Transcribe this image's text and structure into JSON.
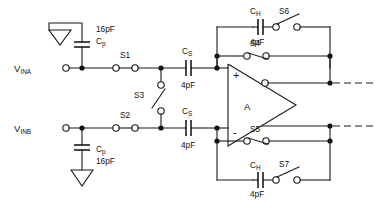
{
  "diagram": {
    "amplifier": {
      "label": "A",
      "plus_pin": "+",
      "minus_pin": "-"
    },
    "ports": [
      {
        "name": "vina",
        "label_main": "V",
        "label_sub": "INA"
      },
      {
        "name": "vinb",
        "label_main": "V",
        "label_sub": "INB"
      }
    ],
    "capacitors": [
      {
        "name": "cp-top",
        "label_main": "C",
        "label_sub": "p",
        "value": "16pF"
      },
      {
        "name": "cp-bottom",
        "label_main": "C",
        "label_sub": "p",
        "value": "16pF"
      },
      {
        "name": "cs-top",
        "label_main": "C",
        "label_sub": "S",
        "value": "4pF"
      },
      {
        "name": "cs-bottom",
        "label_main": "C",
        "label_sub": "S",
        "value": "4pF"
      },
      {
        "name": "ch-top",
        "label_main": "C",
        "label_sub": "H",
        "value": "4pF"
      },
      {
        "name": "ch-bottom",
        "label_main": "C",
        "label_sub": "H",
        "value": "4pF"
      }
    ],
    "switches": [
      {
        "name": "s1",
        "label": "S1",
        "state": "closed"
      },
      {
        "name": "s2",
        "label": "S2",
        "state": "closed"
      },
      {
        "name": "s3",
        "label": "S3",
        "state": "open"
      },
      {
        "name": "s4",
        "label": "S4",
        "state": "open"
      },
      {
        "name": "s5",
        "label": "S5",
        "state": "open"
      },
      {
        "name": "s6",
        "label": "S6",
        "state": "open"
      },
      {
        "name": "s7",
        "label": "S7",
        "state": "open"
      }
    ],
    "ground_symbols": 2,
    "colors": {
      "ink": "#1a1a1a",
      "background": "#ffffff",
      "node_fill": "#111111",
      "terminal_fill": "#ffffff"
    }
  }
}
